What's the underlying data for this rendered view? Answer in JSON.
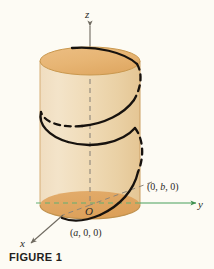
{
  "figure": {
    "caption": "FIGURE 1",
    "background_color": "#fdfbf4"
  },
  "axes": {
    "z": {
      "label": "z",
      "color": "#6f6a60",
      "style": "solid-outside-dashed-inside",
      "direction": "up"
    },
    "y": {
      "label": "y",
      "color": "#49a05a",
      "style": "solid-outside-dashed-inside",
      "direction": "right"
    },
    "x": {
      "label": "x",
      "color": "#6f6a60",
      "style": "solid-outside-dashed-inside",
      "direction": "down-left"
    },
    "origin_label": "O"
  },
  "points": [
    {
      "id": "point-b",
      "label": "(0, b, 0)",
      "prefix": "(0, ",
      "var": "b",
      "suffix": ", 0)",
      "on_axis": "y"
    },
    {
      "id": "point-a",
      "label": "(a, 0, 0)",
      "prefix": "(",
      "var": "a",
      "suffix": ", 0, 0)",
      "on_axis": "x"
    }
  ],
  "cylinder": {
    "top_face_color": "#e8b878",
    "bottom_face_color": "#e2ab6b",
    "body_color_left": "#f0dcbb",
    "body_color_right": "#ecd0a6",
    "outline_color": "#cfa86f",
    "center_x": 90,
    "top_center_y": 61,
    "bottom_center_y": 205,
    "radius_x": 50,
    "radius_y": 14
  },
  "helix": {
    "color": "#17120e",
    "visible_style": "solid",
    "hidden_style": "dashed",
    "turns": 2
  }
}
